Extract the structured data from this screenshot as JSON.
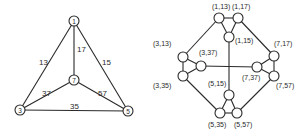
{
  "left_graph": {
    "nodes": [
      {
        "id": "1",
        "label": "1",
        "x": 74,
        "y": 21
      },
      {
        "id": "7",
        "label": "7",
        "x": 74,
        "y": 80
      },
      {
        "id": "3",
        "label": "3",
        "x": 20,
        "y": 110
      },
      {
        "id": "5",
        "label": "5",
        "x": 128,
        "y": 111
      }
    ],
    "edges": [
      {
        "from": "1",
        "to": "3",
        "label": "13",
        "lx": 39,
        "ly": 65
      },
      {
        "from": "1",
        "to": "7",
        "label": "17",
        "lx": 77,
        "ly": 52
      },
      {
        "from": "1",
        "to": "5",
        "label": "15",
        "lx": 102,
        "ly": 65
      },
      {
        "from": "7",
        "to": "3",
        "label": "37",
        "lx": 42,
        "ly": 96
      },
      {
        "from": "7",
        "to": "5",
        "label": "57",
        "lx": 98,
        "ly": 96
      },
      {
        "from": "3",
        "to": "5",
        "label": "35",
        "lx": 70,
        "ly": 109
      }
    ]
  },
  "right_graph": {
    "nodes": [
      {
        "id": "1_13",
        "label": "(1,13)",
        "x": 219,
        "y": 18,
        "lx": 212,
        "ly": 9
      },
      {
        "id": "1_17",
        "label": "(1,17)",
        "x": 238,
        "y": 18,
        "lx": 232,
        "ly": 9
      },
      {
        "id": "1_15",
        "label": "(1,15)",
        "x": 229,
        "y": 37,
        "lx": 235,
        "ly": 43
      },
      {
        "id": "3_13",
        "label": "(3,13)",
        "x": 183,
        "y": 57,
        "lx": 153,
        "ly": 46
      },
      {
        "id": "3_37",
        "label": "(3,37)",
        "x": 201,
        "y": 66,
        "lx": 199,
        "ly": 55
      },
      {
        "id": "3_35",
        "label": "(3,35)",
        "x": 183,
        "y": 76,
        "lx": 153,
        "ly": 88
      },
      {
        "id": "7_17",
        "label": "(7,17)",
        "x": 274,
        "y": 56,
        "lx": 274,
        "ly": 46
      },
      {
        "id": "7_37",
        "label": "(7,37)",
        "x": 257,
        "y": 67,
        "lx": 242,
        "ly": 80
      },
      {
        "id": "7_57",
        "label": "(7,57)",
        "x": 274,
        "y": 76,
        "lx": 276,
        "ly": 88
      },
      {
        "id": "5_15",
        "label": "(5,15)",
        "x": 229,
        "y": 95,
        "lx": 208,
        "ly": 86
      },
      {
        "id": "5_35",
        "label": "(5,35)",
        "x": 220,
        "y": 113,
        "lx": 208,
        "ly": 127
      },
      {
        "id": "5_57",
        "label": "(5,57)",
        "x": 237,
        "y": 113,
        "lx": 234,
        "ly": 127
      }
    ],
    "edges": [
      [
        "1_13",
        "1_17"
      ],
      [
        "1_13",
        "1_15"
      ],
      [
        "1_17",
        "1_15"
      ],
      [
        "3_13",
        "3_37"
      ],
      [
        "3_13",
        "3_35"
      ],
      [
        "3_37",
        "3_35"
      ],
      [
        "7_17",
        "7_37"
      ],
      [
        "7_17",
        "7_57"
      ],
      [
        "7_37",
        "7_57"
      ],
      [
        "5_15",
        "5_35"
      ],
      [
        "5_15",
        "5_57"
      ],
      [
        "5_35",
        "5_57"
      ],
      [
        "1_13",
        "3_13"
      ],
      [
        "1_17",
        "7_17"
      ],
      [
        "3_35",
        "5_35"
      ],
      [
        "7_57",
        "5_57"
      ],
      [
        "1_15",
        "5_15"
      ],
      [
        "3_37",
        "7_37"
      ]
    ]
  }
}
